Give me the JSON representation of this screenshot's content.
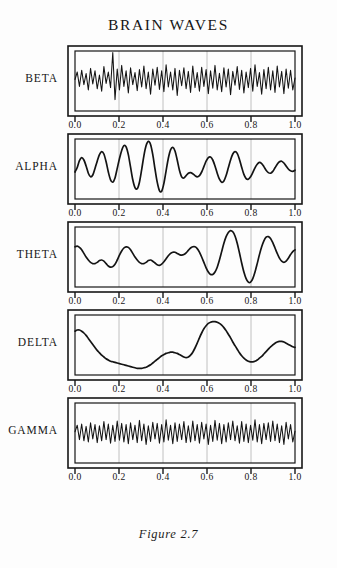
{
  "title": "BRAIN WAVES",
  "caption": "Figure 2.7",
  "colors": {
    "background": "#fdfdfd",
    "ink": "#161616",
    "trace": "#141414",
    "gridline": "#b9b9b9",
    "frame": "#161616"
  },
  "axis": {
    "label": "",
    "ticks": [
      0.0,
      0.2,
      0.4,
      0.6,
      0.8,
      1.0
    ],
    "tick_labels": [
      "0.0",
      "0.2",
      "0.4",
      "0.6",
      "0.8",
      "1.0"
    ],
    "gridlines_at": [
      0.2,
      0.4,
      0.6,
      0.8
    ],
    "xlim": [
      0.0,
      1.0
    ]
  },
  "chart_data": {
    "type": "line",
    "title": "BRAIN WAVES",
    "xlabel": "",
    "ylabel": "",
    "xlim": [
      0.0,
      1.0
    ],
    "ylim": [
      -1.0,
      1.0
    ],
    "grid": true,
    "legend_position": "left-labels",
    "panel_count": 5,
    "shared_x_axis": true,
    "x_tick_labels": [
      "0.0",
      "0.2",
      "0.4",
      "0.6",
      "0.8",
      "1.0"
    ],
    "series": [
      {
        "name": "BETA",
        "label": "BETA",
        "order": 1,
        "frequency_character": "medium-high",
        "dominant_frequency_cycles": 26,
        "amplitude_mean": 0.42,
        "amplitude_peak": 0.95,
        "description": "Fast irregular oscillation with variable amplitude; pronounced spike near x=0.22.",
        "values": [
          0.05,
          0.3,
          -0.18,
          0.36,
          -0.12,
          0.25,
          -0.3,
          0.42,
          -0.1,
          0.34,
          -0.26,
          0.2,
          -0.34,
          0.48,
          -0.08,
          0.3,
          -0.22,
          0.95,
          -0.62,
          0.4,
          -0.3,
          0.52,
          -0.18,
          0.34,
          -0.4,
          0.44,
          -0.12,
          0.28,
          -0.32,
          0.38,
          -0.2,
          0.5,
          -0.26,
          0.3,
          -0.44,
          0.4,
          -0.14,
          0.46,
          -0.28,
          0.34,
          -0.36,
          0.54,
          -0.2,
          0.3,
          -0.3,
          0.42,
          -0.48,
          0.36,
          -0.16,
          0.44,
          -0.26,
          0.32,
          -0.38,
          0.5,
          -0.22,
          0.28,
          -0.34,
          0.46,
          -0.18,
          0.38,
          -0.42,
          0.34,
          -0.24,
          0.52,
          -0.3,
          0.26,
          -0.36,
          0.44,
          -0.2,
          0.4,
          -0.46,
          0.32,
          -0.14,
          0.48,
          -0.28,
          0.36,
          -0.4,
          0.3,
          -0.22,
          0.42,
          -0.34,
          0.54,
          -0.18,
          0.28,
          -0.44,
          0.38,
          -0.26,
          0.46,
          -0.3,
          0.34,
          -0.38,
          0.5,
          -0.2,
          0.32,
          -0.42,
          0.4,
          -0.24,
          0.36,
          -0.3,
          0.1
        ]
      },
      {
        "name": "ALPHA",
        "label": "ALPHA",
        "order": 2,
        "frequency_character": "medium",
        "dominant_frequency_cycles": 9,
        "amplitude_mean": 0.5,
        "amplitude_peak": 0.92,
        "description": "Smooth sinusoidal bursts; amplitude swells to maximum near x=0.40 then tapers after x=0.60.",
        "values": [
          -0.1,
          0.05,
          0.28,
          0.38,
          0.3,
          0.1,
          -0.14,
          -0.26,
          -0.2,
          0.02,
          0.26,
          0.48,
          0.58,
          0.5,
          0.24,
          -0.1,
          -0.36,
          -0.44,
          -0.3,
          0.02,
          0.34,
          0.62,
          0.78,
          0.74,
          0.48,
          0.06,
          -0.36,
          -0.62,
          -0.66,
          -0.44,
          -0.02,
          0.44,
          0.78,
          0.92,
          0.82,
          0.48,
          0.0,
          -0.44,
          -0.72,
          -0.74,
          -0.48,
          -0.06,
          0.36,
          0.64,
          0.72,
          0.6,
          0.3,
          -0.04,
          -0.26,
          -0.3,
          -0.22,
          -0.14,
          -0.12,
          -0.16,
          -0.22,
          -0.26,
          -0.22,
          -0.1,
          0.08,
          0.26,
          0.38,
          0.4,
          0.3,
          0.1,
          -0.14,
          -0.34,
          -0.44,
          -0.4,
          -0.22,
          0.04,
          0.3,
          0.5,
          0.58,
          0.52,
          0.32,
          0.06,
          -0.18,
          -0.32,
          -0.34,
          -0.26,
          -0.12,
          0.04,
          0.16,
          0.22,
          0.18,
          0.08,
          -0.04,
          -0.12,
          -0.14,
          -0.08,
          0.04,
          0.16,
          0.24,
          0.26,
          0.2,
          0.1,
          0.0,
          -0.06,
          -0.08,
          -0.04
        ]
      },
      {
        "name": "THETA",
        "label": "THETA",
        "order": 3,
        "frequency_character": "low-medium",
        "dominant_frequency_cycles": 6,
        "amplitude_mean": 0.38,
        "amplitude_peak": 0.9,
        "description": "Slow rolling waves of modest amplitude, then a large excursion: tall peak at x=0.78, deep trough at x=0.88.",
        "values": [
          0.34,
          0.36,
          0.32,
          0.24,
          0.12,
          0.0,
          -0.1,
          -0.18,
          -0.22,
          -0.22,
          -0.18,
          -0.12,
          -0.1,
          -0.14,
          -0.22,
          -0.3,
          -0.34,
          -0.32,
          -0.24,
          -0.1,
          0.06,
          0.2,
          0.3,
          0.34,
          0.32,
          0.24,
          0.12,
          0.0,
          -0.1,
          -0.18,
          -0.22,
          -0.22,
          -0.18,
          -0.12,
          -0.1,
          -0.14,
          -0.2,
          -0.26,
          -0.28,
          -0.24,
          -0.16,
          -0.06,
          0.04,
          0.12,
          0.16,
          0.16,
          0.12,
          0.08,
          0.06,
          0.08,
          0.14,
          0.22,
          0.3,
          0.34,
          0.34,
          0.28,
          0.16,
          0.0,
          -0.18,
          -0.36,
          -0.5,
          -0.58,
          -0.58,
          -0.5,
          -0.34,
          -0.1,
          0.18,
          0.46,
          0.68,
          0.82,
          0.88,
          0.84,
          0.7,
          0.46,
          0.14,
          -0.2,
          -0.5,
          -0.72,
          -0.84,
          -0.84,
          -0.72,
          -0.5,
          -0.22,
          0.08,
          0.34,
          0.54,
          0.66,
          0.68,
          0.62,
          0.48,
          0.3,
          0.12,
          -0.04,
          -0.14,
          -0.18,
          -0.14,
          -0.04,
          0.08,
          0.18,
          0.24
        ]
      },
      {
        "name": "DELTA",
        "label": "DELTA",
        "order": 4,
        "frequency_character": "very low",
        "dominant_frequency_cycles": 2,
        "amplitude_mean": 0.45,
        "amplitude_peak": 0.78,
        "description": "Very slow drift: starts high, falls to minimum near x=0.40, small rise at x=0.55, broad dominant peak at x=0.75, then descends.",
        "values": [
          0.46,
          0.5,
          0.5,
          0.46,
          0.4,
          0.32,
          0.22,
          0.12,
          0.02,
          -0.08,
          -0.18,
          -0.26,
          -0.34,
          -0.4,
          -0.46,
          -0.5,
          -0.54,
          -0.56,
          -0.58,
          -0.6,
          -0.62,
          -0.64,
          -0.66,
          -0.68,
          -0.7,
          -0.72,
          -0.74,
          -0.76,
          -0.78,
          -0.78,
          -0.78,
          -0.76,
          -0.74,
          -0.7,
          -0.66,
          -0.6,
          -0.54,
          -0.48,
          -0.42,
          -0.36,
          -0.32,
          -0.28,
          -0.26,
          -0.24,
          -0.24,
          -0.26,
          -0.28,
          -0.32,
          -0.36,
          -0.4,
          -0.42,
          -0.4,
          -0.34,
          -0.24,
          -0.1,
          0.06,
          0.24,
          0.4,
          0.54,
          0.64,
          0.72,
          0.76,
          0.78,
          0.78,
          0.76,
          0.72,
          0.66,
          0.58,
          0.48,
          0.36,
          0.24,
          0.1,
          -0.02,
          -0.14,
          -0.26,
          -0.36,
          -0.44,
          -0.5,
          -0.54,
          -0.56,
          -0.56,
          -0.54,
          -0.5,
          -0.44,
          -0.38,
          -0.3,
          -0.22,
          -0.14,
          -0.06,
          0.0,
          0.06,
          0.1,
          0.12,
          0.12,
          0.1,
          0.06,
          0.02,
          -0.02,
          -0.06,
          -0.08
        ]
      },
      {
        "name": "GAMMA",
        "label": "GAMMA",
        "order": 5,
        "frequency_character": "very high",
        "dominant_frequency_cycles": 52,
        "amplitude_mean": 0.3,
        "amplitude_peak": 0.72,
        "description": "Dense very fast oscillation of small, fairly uniform amplitude across the whole trace.",
        "values": [
          0.04,
          0.26,
          -0.22,
          0.3,
          -0.26,
          0.22,
          -0.3,
          0.34,
          -0.2,
          0.28,
          -0.32,
          0.24,
          -0.26,
          0.38,
          -0.22,
          0.3,
          -0.34,
          0.26,
          -0.28,
          0.4,
          -0.24,
          0.32,
          -0.3,
          0.28,
          -0.36,
          0.34,
          -0.22,
          0.26,
          -0.32,
          0.42,
          -0.26,
          0.3,
          -0.38,
          0.24,
          -0.28,
          0.36,
          -0.2,
          0.32,
          -0.34,
          0.28,
          -0.3,
          0.44,
          -0.24,
          0.26,
          -0.36,
          0.34,
          -0.28,
          0.3,
          -0.22,
          0.38,
          -0.32,
          0.24,
          -0.3,
          0.4,
          -0.26,
          0.28,
          -0.34,
          0.36,
          -0.2,
          0.3,
          -0.38,
          0.26,
          -0.28,
          0.42,
          -0.24,
          0.32,
          -0.36,
          0.28,
          -0.3,
          0.34,
          -0.22,
          0.4,
          -0.26,
          0.24,
          -0.34,
          0.38,
          -0.28,
          0.3,
          -0.32,
          0.26,
          -0.24,
          0.44,
          -0.3,
          0.28,
          -0.36,
          0.32,
          -0.22,
          0.34,
          -0.28,
          0.4,
          -0.26,
          0.3,
          -0.32,
          0.24,
          -0.38,
          0.36,
          -0.2,
          0.28,
          -0.3,
          0.06
        ]
      }
    ]
  }
}
